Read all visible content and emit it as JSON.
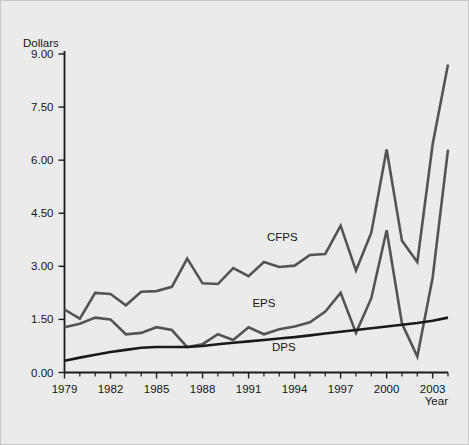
{
  "chart_data": {
    "type": "line",
    "title": "",
    "xlabel": "Year",
    "ylabel": "Dollars",
    "xlim": [
      1979,
      2004
    ],
    "ylim": [
      0.0,
      9.0
    ],
    "grid": false,
    "legend": "inline-labels",
    "y_ticks": [
      "0.00",
      "1.50",
      "3.00",
      "4.50",
      "6.00",
      "7.50",
      "9.00"
    ],
    "y_tick_values": [
      0.0,
      1.5,
      3.0,
      4.5,
      6.0,
      7.5,
      9.0
    ],
    "x_ticks": [
      "1979",
      "1982",
      "1985",
      "1988",
      "1991",
      "1994",
      "1997",
      "2000",
      "2003"
    ],
    "x_tick_values": [
      1979,
      1982,
      1985,
      1988,
      1991,
      1994,
      1997,
      2000,
      2003
    ],
    "x": [
      1979,
      1980,
      1981,
      1982,
      1983,
      1984,
      1985,
      1986,
      1987,
      1988,
      1989,
      1990,
      1991,
      1992,
      1993,
      1994,
      1995,
      1996,
      1997,
      1998,
      1999,
      2000,
      2001,
      2002,
      2003,
      2004
    ],
    "series": [
      {
        "name": "CFPS",
        "color": "#545454",
        "values": [
          1.78,
          1.52,
          2.25,
          2.22,
          1.9,
          2.28,
          2.3,
          2.42,
          3.22,
          2.52,
          2.5,
          2.95,
          2.72,
          3.12,
          2.98,
          3.02,
          3.32,
          3.35,
          4.15,
          2.88,
          3.95,
          6.3,
          3.72,
          3.12,
          6.45,
          8.7
        ]
      },
      {
        "name": "EPS",
        "color": "#545454",
        "values": [
          1.28,
          1.38,
          1.55,
          1.5,
          1.08,
          1.12,
          1.28,
          1.2,
          0.72,
          0.8,
          1.08,
          0.92,
          1.28,
          1.08,
          1.22,
          1.3,
          1.42,
          1.72,
          2.25,
          1.12,
          2.1,
          4.02,
          1.38,
          0.45,
          2.68,
          6.3
        ]
      },
      {
        "name": "DPS",
        "color": "#1a1a1a",
        "values": [
          0.33,
          0.42,
          0.5,
          0.58,
          0.64,
          0.7,
          0.72,
          0.72,
          0.72,
          0.75,
          0.8,
          0.84,
          0.88,
          0.92,
          0.96,
          1.0,
          1.05,
          1.1,
          1.15,
          1.2,
          1.25,
          1.3,
          1.35,
          1.4,
          1.46,
          1.55
        ]
      }
    ],
    "annotations": [
      {
        "text": "CFPS",
        "x": 1993.2,
        "y": 3.72
      },
      {
        "text": "EPS",
        "x": 1992.0,
        "y": 1.86
      },
      {
        "text": "DPS",
        "x": 1993.3,
        "y": 0.62
      }
    ]
  }
}
